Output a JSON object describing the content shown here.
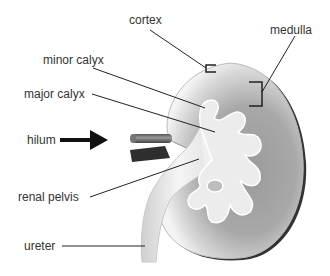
{
  "diagram": {
    "labels": {
      "cortex": "cortex",
      "medulla": "medulla",
      "minor_calyx": "minor calyx",
      "major_calyx": "major calyx",
      "hilum": "hilum",
      "renal_pelvis": "renal pelvis",
      "ureter": "ureter"
    },
    "colors": {
      "line": "#222222",
      "text": "#333333",
      "kidney_light": "#f2f2f2",
      "kidney_dark": "#8a8a8a",
      "outline": "#3a3a3a"
    }
  }
}
